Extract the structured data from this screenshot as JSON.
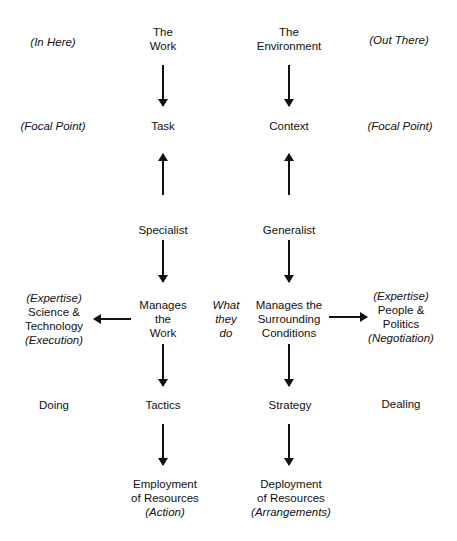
{
  "columns": {
    "left_side": {
      "in_here": "(In Here)",
      "focal_point": "(Focal Point)",
      "expertise_lines": [
        "(Expertise)",
        "Science &",
        "Technology",
        "(Execution)"
      ],
      "doing": "Doing"
    },
    "left_main": {
      "top_lines": [
        "The",
        "Work"
      ],
      "focal": "Task",
      "role": "Specialist",
      "manages_lines": [
        "Manages",
        "the",
        "Work"
      ],
      "approach": "Tactics",
      "outcome_lines": [
        "Employment",
        "of Resources",
        "(Action)"
      ]
    },
    "center": {
      "what_they_do_lines": [
        "What",
        "they",
        "do"
      ]
    },
    "right_main": {
      "top_lines": [
        "The",
        "Environment"
      ],
      "focal": "Context",
      "role": "Generalist",
      "manages_lines": [
        "Manages the",
        "Surrounding",
        "Conditions"
      ],
      "approach": "Strategy",
      "outcome_lines": [
        "Deployment",
        "of Resources",
        "(Arrangements)"
      ]
    },
    "right_side": {
      "out_there": "(Out There)",
      "focal_point": "(Focal Point)",
      "expertise_lines": [
        "(Expertise)",
        "People &",
        "Politics",
        "(Negotiation)"
      ],
      "dealing": "Dealing"
    }
  },
  "arrows": [
    {
      "name": "work-to-task",
      "direction": "down"
    },
    {
      "name": "environment-to-context",
      "direction": "down"
    },
    {
      "name": "specialist-to-task",
      "direction": "up"
    },
    {
      "name": "generalist-to-context",
      "direction": "up"
    },
    {
      "name": "specialist-to-manages-work",
      "direction": "down"
    },
    {
      "name": "generalist-to-manages-conditions",
      "direction": "down"
    },
    {
      "name": "manages-work-to-science",
      "direction": "left"
    },
    {
      "name": "manages-conditions-to-people",
      "direction": "right"
    },
    {
      "name": "manages-work-to-tactics",
      "direction": "down"
    },
    {
      "name": "manages-conditions-to-strategy",
      "direction": "down"
    },
    {
      "name": "tactics-to-employment",
      "direction": "down"
    },
    {
      "name": "strategy-to-deployment",
      "direction": "down"
    }
  ],
  "colors": {
    "ink": "#111111",
    "background": "#ffffff"
  }
}
